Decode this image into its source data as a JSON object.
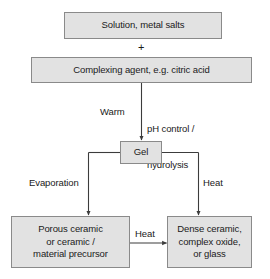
{
  "diagram": {
    "nodes": {
      "solution": "Solution, metal salts",
      "plus": "+",
      "complexing_agent": "Complexing agent, e.g. citric acid",
      "gel": "Gel",
      "porous_ceramic_line1": "Porous ceramic",
      "porous_ceramic_line2": "or ceramic /",
      "porous_ceramic_line3": "material precursor",
      "dense_ceramic_line1": "Dense ceramic,",
      "dense_ceramic_line2": "complex oxide,",
      "dense_ceramic_line3": "or glass"
    },
    "edge_labels": {
      "warm": "Warm",
      "ph_control_line1": "pH control /",
      "ph_control_line2": "hydrolysis",
      "evaporation": "Evaporation",
      "heat_right": "Heat",
      "heat_middle": "Heat"
    },
    "colors": {
      "box_fill": "#e2e2e2",
      "box_border": "#8a8a8a",
      "line": "#3c3c3c",
      "text": "#1a1a1a",
      "background": "#ffffff"
    }
  }
}
